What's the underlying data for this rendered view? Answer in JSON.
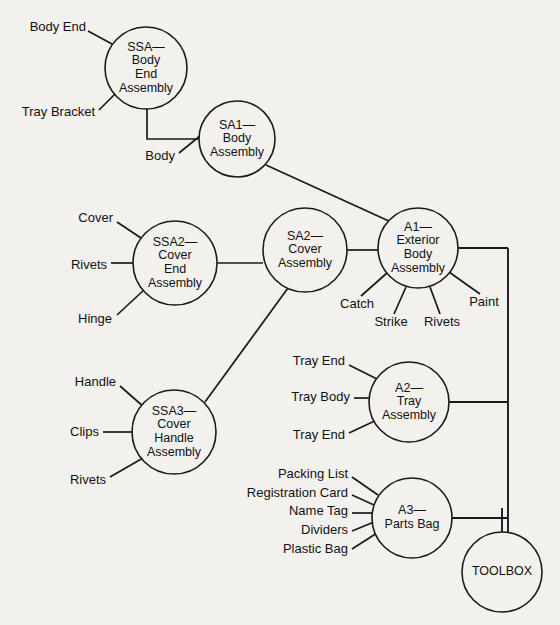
{
  "diagram": {
    "background_color": "#f2f1ee",
    "line_color": "#1a1a1a",
    "nodes": [
      {
        "id": "ssa-body-end",
        "label_lines": [
          "SSA—",
          "Body",
          "End",
          "Assembly"
        ],
        "cx": 146,
        "cy": 68,
        "r": 41
      },
      {
        "id": "sa1-body",
        "label_lines": [
          "SA1—",
          "Body",
          "Assembly"
        ],
        "cx": 237,
        "cy": 139,
        "r": 38
      },
      {
        "id": "ssa2-cover-end",
        "label_lines": [
          "SSA2—",
          "Cover",
          "End",
          "Assembly"
        ],
        "cx": 175,
        "cy": 263,
        "r": 42
      },
      {
        "id": "sa2-cover",
        "label_lines": [
          "SA2—",
          "Cover",
          "Assembly"
        ],
        "cx": 305,
        "cy": 250,
        "r": 42
      },
      {
        "id": "a1-exterior-body",
        "label_lines": [
          "A1—",
          "Exterior",
          "Body",
          "Assembly"
        ],
        "cx": 418,
        "cy": 248,
        "r": 40
      },
      {
        "id": "ssa3-cover-handle",
        "label_lines": [
          "SSA3—",
          "Cover",
          "Handle",
          "Assembly"
        ],
        "cx": 174,
        "cy": 432,
        "r": 42
      },
      {
        "id": "a2-tray",
        "label_lines": [
          "A2—",
          "Tray",
          "Assembly"
        ],
        "cx": 409,
        "cy": 402,
        "r": 40
      },
      {
        "id": "a3-parts-bag",
        "label_lines": [
          "A3—",
          "Parts Bag"
        ],
        "cx": 412,
        "cy": 518,
        "r": 40
      },
      {
        "id": "toolbox",
        "label_lines": [
          "TOOLBOX"
        ],
        "cx": 502,
        "cy": 572,
        "r": 40
      }
    ],
    "part_labels": [
      {
        "id": "body-end",
        "text": "Body End",
        "x": 86,
        "y": 28,
        "anchor": "end"
      },
      {
        "id": "tray-bracket",
        "text": "Tray Bracket",
        "x": 95,
        "y": 113,
        "anchor": "end"
      },
      {
        "id": "body",
        "text": "Body",
        "x": 175,
        "y": 157,
        "anchor": "end"
      },
      {
        "id": "cover",
        "text": "Cover",
        "x": 113,
        "y": 219,
        "anchor": "end"
      },
      {
        "id": "rivets-cover-end",
        "text": "Rivets",
        "x": 107,
        "y": 266,
        "anchor": "end"
      },
      {
        "id": "hinge",
        "text": "Hinge",
        "x": 112,
        "y": 320,
        "anchor": "end"
      },
      {
        "id": "catch",
        "text": "Catch",
        "x": 357,
        "y": 305,
        "anchor": "middle"
      },
      {
        "id": "strike",
        "text": "Strike",
        "x": 391,
        "y": 323,
        "anchor": "middle"
      },
      {
        "id": "rivets-a1",
        "text": "Rivets",
        "x": 442,
        "y": 323,
        "anchor": "middle"
      },
      {
        "id": "paint",
        "text": "Paint",
        "x": 484,
        "y": 303,
        "anchor": "middle"
      },
      {
        "id": "handle",
        "text": "Handle",
        "x": 116,
        "y": 383,
        "anchor": "end"
      },
      {
        "id": "clips",
        "text": "Clips",
        "x": 99,
        "y": 433,
        "anchor": "end"
      },
      {
        "id": "rivets-handle",
        "text": "Rivets",
        "x": 106,
        "y": 481,
        "anchor": "end"
      },
      {
        "id": "tray-end-top",
        "text": "Tray End",
        "x": 345,
        "y": 362,
        "anchor": "end"
      },
      {
        "id": "tray-body",
        "text": "Tray Body",
        "x": 350,
        "y": 398,
        "anchor": "end"
      },
      {
        "id": "tray-end-bottom",
        "text": "Tray End",
        "x": 345,
        "y": 436,
        "anchor": "end"
      },
      {
        "id": "packing-list",
        "text": "Packing List",
        "x": 348,
        "y": 475,
        "anchor": "end"
      },
      {
        "id": "registration-card",
        "text": "Registration Card",
        "x": 348,
        "y": 494,
        "anchor": "end"
      },
      {
        "id": "name-tag",
        "text": "Name Tag",
        "x": 348,
        "y": 512,
        "anchor": "end"
      },
      {
        "id": "dividers",
        "text": "Dividers",
        "x": 348,
        "y": 531,
        "anchor": "end"
      },
      {
        "id": "plastic-bag",
        "text": "Plastic Bag",
        "x": 348,
        "y": 550,
        "anchor": "end"
      }
    ],
    "connectors": [
      {
        "id": "body-end-to-ssa",
        "points": "88,31 112,44"
      },
      {
        "id": "tray-bracket-to-ssa",
        "points": "99,110 118,91"
      },
      {
        "id": "ssa-to-sa1",
        "points": "147,109 147,139 200,139"
      },
      {
        "id": "body-to-sa1",
        "points": "179,153 206,131"
      },
      {
        "id": "sa1-to-a1",
        "points": "266,165 391,222"
      },
      {
        "id": "cover-to-ssa2",
        "points": "117,222 144,240"
      },
      {
        "id": "rivets-to-ssa2",
        "points": "111,263 134,263"
      },
      {
        "id": "hinge-to-ssa2",
        "points": "117,315 145,289"
      },
      {
        "id": "ssa2-to-sa2",
        "points": "217,263 263,263"
      },
      {
        "id": "sa2-to-a1",
        "points": "347,250 378,250"
      },
      {
        "id": "catch-to-a1",
        "points": "361,296 387,273"
      },
      {
        "id": "strike-to-a1",
        "points": "394,314 406,287"
      },
      {
        "id": "rivets-to-a1",
        "points": "440,314 430,287"
      },
      {
        "id": "paint-to-a1",
        "points": "480,294 449,272"
      },
      {
        "id": "sa2-to-ssa3",
        "points": "288,288 205,402"
      },
      {
        "id": "handle-to-ssa3",
        "points": "120,386 145,408"
      },
      {
        "id": "clips-to-ssa3",
        "points": "103,432 132,432"
      },
      {
        "id": "rivets-to-ssa3",
        "points": "110,477 143,458"
      },
      {
        "id": "tray-end-top-to-a2",
        "points": "349,365 381,381"
      },
      {
        "id": "tray-body-to-a2",
        "points": "354,398 369,398"
      },
      {
        "id": "tray-end-bottom-to-a2",
        "points": "349,433 381,418"
      },
      {
        "id": "packing-list-to-a3",
        "points": "352,477 378,495"
      },
      {
        "id": "registration-card-to-a3",
        "points": "352,495 374,505"
      },
      {
        "id": "name-tag-to-a3",
        "points": "352,513 372,513"
      },
      {
        "id": "dividers-to-a3",
        "points": "352,531 374,522"
      },
      {
        "id": "plastic-bag-to-a3",
        "points": "352,549 377,533"
      }
    ],
    "bus": {
      "id": "main-bus",
      "a1_stub": "458,248 508,248",
      "vertical": "508,248 508,532",
      "a2_stub": "449,402 508,402",
      "a3_stub": "452,518 508,518",
      "toolbox_stub": "502,508 502,533"
    }
  }
}
